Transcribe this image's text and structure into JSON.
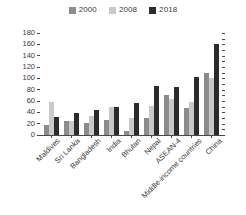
{
  "chart_data": {
    "type": "bar",
    "title": "",
    "subtitle": "",
    "xlabel": "",
    "ylabel": "",
    "ylim": [
      0,
      180
    ],
    "ytick_step": 20,
    "yticks": [
      180,
      160,
      140,
      120,
      100,
      80,
      60,
      40,
      20,
      0
    ],
    "grid": false,
    "legend_position": "top-center",
    "categories": [
      "Maldives",
      "Sri Lanka",
      "Bangladesh",
      "India",
      "Bhutan",
      "Nepal",
      "ASEAN-4",
      "Middle-income countries",
      "China"
    ],
    "series": [
      {
        "name": "2000",
        "color": "#8c8c8c",
        "values": [
          18,
          24,
          21,
          27,
          7,
          30,
          70,
          48,
          110
        ]
      },
      {
        "name": "2008",
        "color": "#c9c9c9",
        "values": [
          58,
          24,
          34,
          49,
          30,
          51,
          63,
          59,
          101
        ]
      },
      {
        "name": "2018",
        "color": "#2b2b2b",
        "values": [
          31,
          38,
          45,
          49,
          56,
          86,
          84,
          103,
          160
        ]
      }
    ]
  },
  "axis": {
    "tick_color": "#4a4a4a",
    "label_color": "#3a3a3a"
  }
}
